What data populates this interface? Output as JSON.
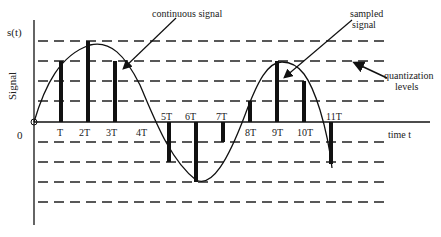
{
  "diagram": {
    "y_axis_label": "s(t)",
    "y_axis_title": "Signal",
    "x_axis_title": "time t",
    "origin_label": "0",
    "annotations": {
      "continuous": "continuous signal",
      "sampled_line1": "sampled",
      "sampled_line2": "signal",
      "quant_line1": "quantization",
      "quant_line2": "levels"
    },
    "ticks": [
      "T",
      "2T",
      "3T",
      "4T",
      "5T",
      "6T",
      "7T",
      "8T",
      "9T",
      "10T",
      "11T"
    ],
    "quantization_levels_above": 4,
    "quantization_levels_below": 4,
    "samples": [
      {
        "label": "T",
        "level": 3
      },
      {
        "label": "2T",
        "level": 4
      },
      {
        "label": "3T",
        "level": 3
      },
      {
        "label": "4T",
        "level": 0
      },
      {
        "label": "5T",
        "level": -2
      },
      {
        "label": "6T",
        "level": -3
      },
      {
        "label": "7T",
        "level": -1
      },
      {
        "label": "8T",
        "level": 1
      },
      {
        "label": "9T",
        "level": 3
      },
      {
        "label": "10T",
        "level": 2
      },
      {
        "label": "11T",
        "level": -2
      }
    ],
    "colors": {
      "line": "#111111",
      "dash": "#222222",
      "text": "#222222"
    }
  }
}
